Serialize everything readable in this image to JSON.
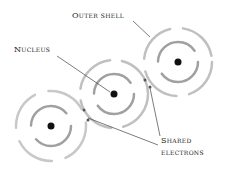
{
  "diagram": {
    "labels": {
      "outer_shell": "Outer shell",
      "nucleus": "Nucleus",
      "shared_line1": "Shared",
      "shared_line2": "electrons"
    },
    "atoms": [
      {
        "name": "left-atom",
        "cx": 51,
        "cy": 126,
        "outer_r": 35,
        "inner_r": 20
      },
      {
        "name": "middle-atom",
        "cx": 114,
        "cy": 94,
        "outer_r": 34,
        "inner_r": 20
      },
      {
        "name": "right-atom",
        "cx": 178,
        "cy": 62,
        "outer_r": 34,
        "inner_r": 20
      }
    ],
    "colors": {
      "shell": "#9a9a9a",
      "nucleus": "#111111",
      "text": "#222222",
      "leader": "#444444"
    }
  }
}
